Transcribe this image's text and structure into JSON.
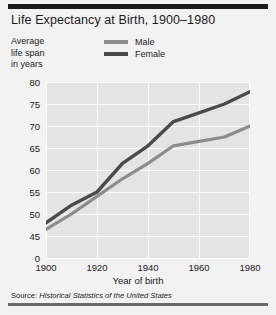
{
  "title": "Life Expectancy at Birth, 1900–1980",
  "yaxis_caption_lines": [
    "Average",
    "life span",
    "in years"
  ],
  "source": {
    "label": "Source:",
    "title": "Historical Statistics of the United States"
  },
  "colors": {
    "male_line": "#8c8c8c",
    "female_line": "#4a4a4a",
    "plot_background": "#e4e4e4",
    "page_background": "#f2f2f2",
    "gridline": "#fbfbfb",
    "rule_top": "#1a1a1a",
    "rule_bottom": "#6b6b6b",
    "text": "#1b1b1b"
  },
  "chart_data": {
    "type": "line",
    "title": "Life Expectancy at Birth, 1900–1980",
    "xlabel": "Year of birth",
    "ylabel": "Average life span in years",
    "xlim": [
      1900,
      1980
    ],
    "ylim": [
      43,
      82
    ],
    "axis_break": true,
    "grid": true,
    "legend_position": "top-center",
    "x": [
      1900,
      1910,
      1920,
      1930,
      1940,
      1950,
      1960,
      1970,
      1980
    ],
    "xticks": [
      "1900",
      "1920",
      "1940",
      "1960",
      "1980"
    ],
    "xtick_values": [
      1900,
      1920,
      1940,
      1960,
      1980
    ],
    "yticks": [
      "80",
      "75",
      "70",
      "65",
      "60",
      "55",
      "50",
      "45",
      "0"
    ],
    "ytick_values": [
      80,
      75,
      70,
      65,
      60,
      55,
      50,
      45,
      0
    ],
    "series": [
      {
        "name": "Male",
        "color": "#8c8c8c",
        "values": [
          46.5,
          50.0,
          54.0,
          58.0,
          61.5,
          65.5,
          66.5,
          67.5,
          70.0
        ]
      },
      {
        "name": "Female",
        "color": "#4a4a4a",
        "values": [
          48.0,
          52.0,
          55.0,
          61.5,
          65.5,
          71.0,
          73.0,
          75.0,
          77.8
        ]
      }
    ]
  }
}
